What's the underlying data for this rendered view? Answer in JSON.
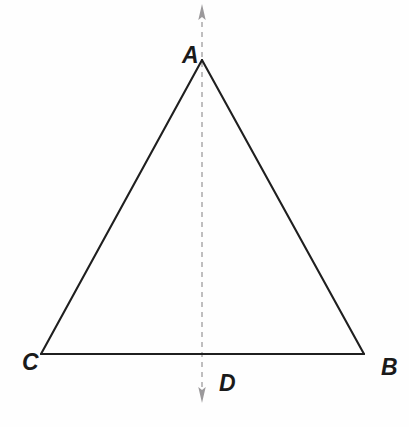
{
  "figure": {
    "kind": "geometry-diagram",
    "background_color": "#fefefe",
    "width": 409,
    "height": 427
  },
  "style": {
    "triangle_stroke_color": "#1f1f1f",
    "triangle_stroke_width": 2.1,
    "axis_stroke_color": "#b0aeb0",
    "axis_stroke_width": 1.6,
    "axis_dash_pattern": "5 5",
    "arrowhead_color": "#9b999b",
    "label_color": "#1a1a1a"
  },
  "points": {
    "A": {
      "label": "A",
      "x": 202,
      "y": 60,
      "label_x": 182,
      "label_y": 44
    },
    "B": {
      "label": "B",
      "x": 364,
      "y": 354,
      "label_x": 381,
      "label_y": 356
    },
    "C": {
      "label": "C",
      "x": 41,
      "y": 354,
      "label_x": 22,
      "label_y": 351
    },
    "D": {
      "label": "D",
      "x": 202,
      "y": 354,
      "label_x": 219,
      "label_y": 372
    }
  },
  "segments": [
    {
      "name": "side-CA",
      "from": "C",
      "to": "A"
    },
    {
      "name": "side-AB",
      "from": "A",
      "to": "B"
    },
    {
      "name": "base-CB",
      "from": "C",
      "to": "B"
    }
  ],
  "axis": {
    "name": "axis-of-symmetry",
    "x": 202,
    "top_y": 4,
    "bottom_y": 403,
    "dashed": true,
    "arrow_top": true,
    "arrow_bottom": true
  }
}
